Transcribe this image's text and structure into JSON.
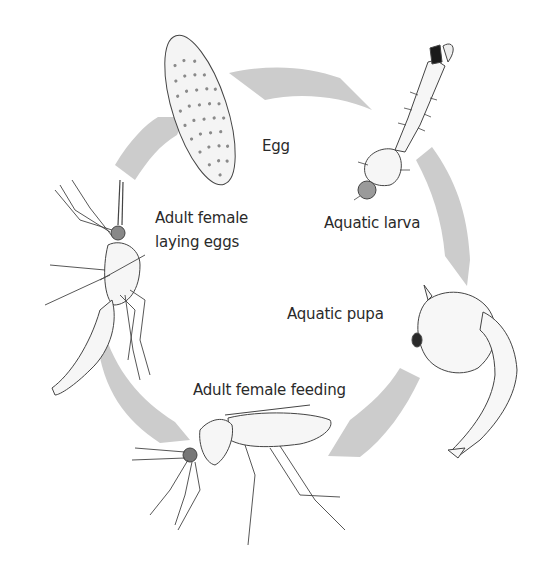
{
  "diagram": {
    "type": "life-cycle",
    "arrow_color": "#cccccc",
    "line_color": "#3a3a3a",
    "stages": [
      {
        "id": "egg",
        "label": "Egg"
      },
      {
        "id": "larva",
        "label": "Aquatic larva"
      },
      {
        "id": "pupa",
        "label": "Aquatic pupa"
      },
      {
        "id": "feeding",
        "label": "Adult female feeding"
      },
      {
        "id": "laying",
        "label_line1": "Adult female",
        "label_line2": "laying eggs"
      }
    ],
    "flow": [
      "Egg",
      "Aquatic larva",
      "Aquatic pupa",
      "Adult female feeding",
      "Adult female laying eggs",
      "Egg"
    ],
    "icons": [
      "egg-illustration",
      "larva-illustration",
      "pupa-illustration",
      "adult-feeding-illustration",
      "adult-laying-illustration"
    ]
  }
}
